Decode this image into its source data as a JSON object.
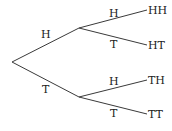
{
  "diagram": {
    "type": "probability-tree",
    "root": {
      "children": [
        {
          "edge_label": "H",
          "children": [
            {
              "edge_label": "H",
              "outcome": "HH"
            },
            {
              "edge_label": "T",
              "outcome": "HT"
            }
          ]
        },
        {
          "edge_label": "T",
          "children": [
            {
              "edge_label": "H",
              "outcome": "TH"
            },
            {
              "edge_label": "T",
              "outcome": "TT"
            }
          ]
        }
      ]
    }
  }
}
